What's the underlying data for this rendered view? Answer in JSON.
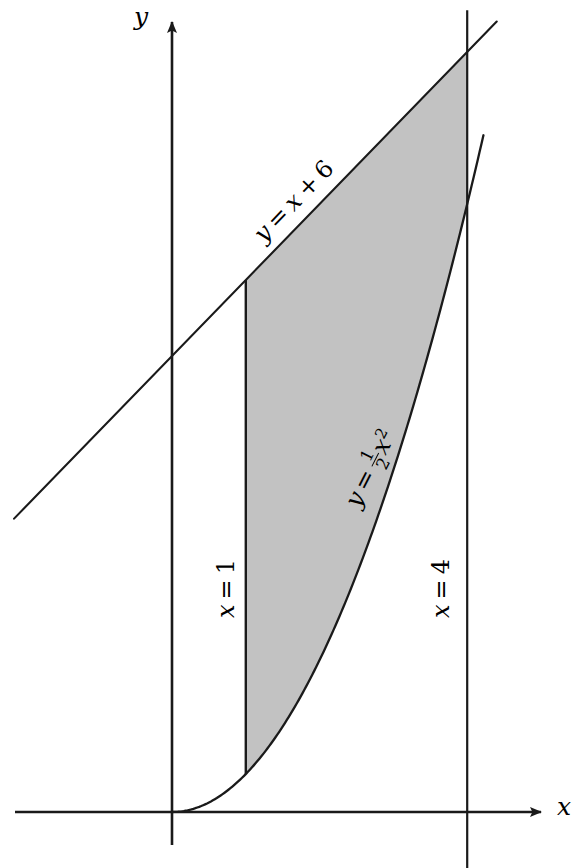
{
  "figure": {
    "kind": "area-between-curves-diagram",
    "width": 578,
    "height": 868,
    "background_color": "#ffffff",
    "ink_color": "#1a1a1a",
    "shade_color": "#c2c2c2"
  },
  "axes": {
    "x_axis_label": "x",
    "y_axis_label": "y",
    "origin_px": [
      172,
      812
    ],
    "x_scale_px_per_unit": 73.8,
    "y_scale_px_per_unit": 76.0,
    "x_axis_y_px": 812,
    "y_axis_x_px": 172,
    "x_axis_arrow_tip_px": [
      553,
      812
    ],
    "y_axis_arrow_tip_px": [
      172,
      10
    ],
    "ticks_shown": false,
    "grid_shown": false
  },
  "labels": {
    "upper_curve": {
      "text": "y = x + 6",
      "lhs": "y",
      "equals": "=",
      "rhs_var": "x",
      "plus": "+",
      "constant": "6",
      "rotation_deg": -46,
      "x_px": 258,
      "y_px": 232
    },
    "lower_curve": {
      "text": "y = 1/2 x^2",
      "lhs": "y",
      "equals": "=",
      "numerator": "1",
      "denominator": "2",
      "rhs_var": "x",
      "exponent": "2",
      "rotation_deg": -63,
      "x_px": 352,
      "y_px": 492
    },
    "left_boundary": {
      "text": "x = 1",
      "lhs": "x",
      "equals": "=",
      "value": "1",
      "rotation_deg": -90,
      "x_px": 226,
      "y_px": 612
    },
    "right_boundary": {
      "text": "x = 4",
      "lhs": "x",
      "equals": "=",
      "value": "4",
      "rotation_deg": -90,
      "x_px": 441,
      "y_px": 612
    }
  },
  "chart_data": {
    "type": "line",
    "title": "",
    "subtitle": "",
    "xlabel": "x",
    "ylabel": "y",
    "xlim": [
      -2.15,
      5.16
    ],
    "ylim": [
      -0.75,
      10.55
    ],
    "grid": false,
    "legend": "none",
    "annotations": [
      "y = x + 6",
      "y = ½x²",
      "x = 1",
      "x = 4"
    ],
    "shaded_region": {
      "label": "area between y = x + 6 and y = ½x²",
      "x_from": 1,
      "x_to": 4,
      "upper_curve": "y = x + 6",
      "lower_curve": "y = 0.5x^2",
      "fill_color": "#c2c2c2"
    },
    "series": [
      {
        "name": "y = x + 6",
        "type": "line",
        "equation": "y = x + 6",
        "slope": 1,
        "intercept": 6,
        "x": [
          -2.14,
          4.4
        ],
        "values": [
          3.86,
          10.4
        ]
      },
      {
        "name": "y = 0.5x^2",
        "type": "curve",
        "equation": "y = 0.5*x^2",
        "x": [
          0,
          0.5,
          1,
          1.5,
          2,
          2.5,
          3,
          3.5,
          4,
          4.22
        ],
        "values": [
          0,
          0.125,
          0.5,
          1.125,
          2,
          3.125,
          4.5,
          6.125,
          8,
          8.91
        ]
      },
      {
        "name": "x = 1",
        "type": "vline",
        "x_value": 1,
        "y_from": 0.5,
        "y_to": 7
      },
      {
        "name": "x = 4",
        "type": "vline",
        "x_value": 4,
        "y_from": -0.75,
        "y_to": 10.55
      }
    ],
    "key_points": [
      {
        "label": "(1, 0.5)",
        "x": 1,
        "y": 0.5
      },
      {
        "label": "(1, 7)",
        "x": 1,
        "y": 7
      },
      {
        "label": "(4, 8)",
        "x": 4,
        "y": 8
      },
      {
        "label": "(4, 10)",
        "x": 4,
        "y": 10
      }
    ]
  }
}
